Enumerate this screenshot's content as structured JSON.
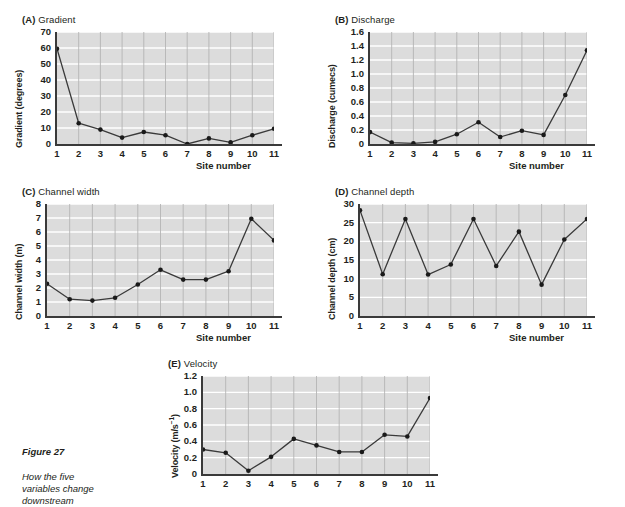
{
  "figure": {
    "caption_title": "Figure 27",
    "caption_body": "How the five\nvariables change\ndownstream"
  },
  "common": {
    "xlabel": "Site number",
    "x_categories": [
      "1",
      "2",
      "3",
      "4",
      "5",
      "6",
      "7",
      "8",
      "9",
      "10",
      "11"
    ]
  },
  "chart_data": [
    {
      "type": "line",
      "panel": "(A)",
      "title": "Gradient",
      "ylabel": "Gradient (degrees)",
      "xlabel": "Site number",
      "categories": [
        "1",
        "2",
        "3",
        "4",
        "5",
        "6",
        "7",
        "8",
        "9",
        "10",
        "11"
      ],
      "values": [
        59.5,
        13,
        9,
        4,
        7.5,
        5.5,
        0,
        3.5,
        1,
        5.5,
        9.5
      ],
      "ylim": [
        0,
        70
      ],
      "ytick_step": 10,
      "yticks": [
        "0",
        "10",
        "20",
        "30",
        "40",
        "50",
        "60",
        "70"
      ],
      "grid": true,
      "legend": "none"
    },
    {
      "type": "line",
      "panel": "(B)",
      "title": "Discharge",
      "ylabel": "Discharge (cumecs)",
      "xlabel": "Site number",
      "categories": [
        "1",
        "2",
        "3",
        "4",
        "5",
        "6",
        "7",
        "8",
        "9",
        "10",
        "11"
      ],
      "values": [
        0.17,
        0.02,
        0.01,
        0.03,
        0.14,
        0.31,
        0.1,
        0.19,
        0.13,
        0.7,
        1.34
      ],
      "ylim": [
        0,
        1.6
      ],
      "ytick_step": 0.2,
      "yticks": [
        "0",
        "0.2",
        "0.4",
        "0.6",
        "0.8",
        "1.0",
        "1.2",
        "1.4",
        "1.6"
      ],
      "grid": true,
      "legend": "none"
    },
    {
      "type": "line",
      "panel": "(C)",
      "title": "Channel width",
      "ylabel": "Channel width (m)",
      "xlabel": "Site number",
      "categories": [
        "1",
        "2",
        "3",
        "4",
        "5",
        "6",
        "7",
        "8",
        "9",
        "10",
        "11"
      ],
      "values": [
        2.3,
        1.2,
        1.1,
        1.3,
        2.25,
        3.3,
        2.6,
        2.6,
        3.2,
        6.95,
        5.4
      ],
      "ylim": [
        0,
        8
      ],
      "ytick_step": 1,
      "yticks": [
        "0",
        "1",
        "2",
        "3",
        "4",
        "5",
        "6",
        "7",
        "8"
      ],
      "grid": true,
      "legend": "none"
    },
    {
      "type": "line",
      "panel": "(D)",
      "title": "Channel depth",
      "ylabel": "Channel depth (cm)",
      "xlabel": "Site number",
      "categories": [
        "1",
        "2",
        "3",
        "4",
        "5",
        "6",
        "7",
        "8",
        "9",
        "10",
        "11"
      ],
      "values": [
        28.3,
        11.2,
        26.0,
        11.1,
        13.8,
        26.0,
        13.4,
        22.6,
        8.4,
        20.5,
        26.0
      ],
      "ylim": [
        0,
        30
      ],
      "ytick_step": 5,
      "yticks": [
        "0",
        "5",
        "10",
        "15",
        "20",
        "25",
        "30"
      ],
      "grid": true,
      "legend": "none"
    },
    {
      "type": "line",
      "panel": "(E)",
      "title": "Velocity",
      "ylabel": "Velocity (m/s⁻¹)",
      "xlabel": "",
      "categories": [
        "1",
        "2",
        "3",
        "4",
        "5",
        "6",
        "7",
        "8",
        "9",
        "10",
        "11"
      ],
      "values": [
        0.3,
        0.26,
        0.04,
        0.21,
        0.43,
        0.35,
        0.27,
        0.27,
        0.48,
        0.46,
        0.93
      ],
      "ylim": [
        0,
        1.2
      ],
      "ytick_step": 0.2,
      "yticks": [
        "0",
        "0.2",
        "0.4",
        "0.6",
        "0.8",
        "1.0",
        "1.2"
      ],
      "grid": true,
      "legend": "none"
    }
  ],
  "colors": {
    "plot_background": "#dcdcdc",
    "gridline_h": "#ffffff",
    "gridline_v": "#b4b4b4",
    "line": "#3a3a3a",
    "marker": "#1a1a1a",
    "axis": "#3a3a3a",
    "text": "#231f20"
  }
}
